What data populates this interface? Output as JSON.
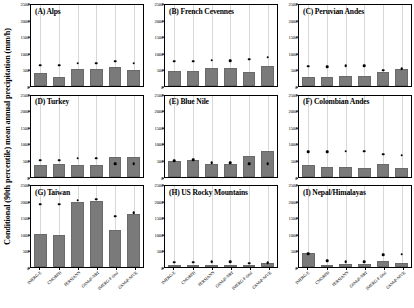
{
  "axis": {
    "ylabel": "Conditional (90th percentile) mean annual precipitation (mm/h)",
    "yticks": [
      0,
      500,
      1000,
      1500,
      2000,
      2500
    ],
    "ymin": 0,
    "ymax": 2500
  },
  "products": [
    "IMERG-E",
    "CMORPH",
    "PERSIANN",
    "GSMaP-NRT",
    "IMERG-F-final",
    "GSMaP-MVK"
  ],
  "colors": {
    "bar": "#7a7a7a",
    "marker": "#000000",
    "grid": "#d8d8d8",
    "axis": "#000000",
    "background": "#ffffff"
  },
  "chart_data": [
    {
      "type": "bar",
      "panel": "A",
      "title": "(A) Alps",
      "categories": [
        "IMERG-E",
        "CMORPH",
        "PERSIANN",
        "GSMaP-NRT",
        "IMERG-F-final",
        "GSMaP-MVK"
      ],
      "values": [
        390,
        290,
        520,
        520,
        600,
        500
      ],
      "markers": [
        640,
        640,
        700,
        700,
        760,
        700
      ],
      "xlabel": "",
      "ylabel": "Conditional (90th percentile) mean annual precipitation (mm/h)",
      "ylim": [
        0,
        2500
      ],
      "grid": true,
      "legend": "none"
    },
    {
      "type": "bar",
      "panel": "B",
      "title": "(B) French Cevennes",
      "categories": [
        "IMERG-E",
        "CMORPH",
        "PERSIANN",
        "GSMaP-NRT",
        "IMERG-F-final",
        "GSMaP-MVK"
      ],
      "values": [
        470,
        470,
        560,
        560,
        430,
        620
      ],
      "markers": [
        760,
        760,
        790,
        780,
        830,
        890
      ],
      "xlabel": "",
      "ylabel": "",
      "ylim": [
        0,
        2500
      ],
      "grid": true,
      "legend": "none"
    },
    {
      "type": "bar",
      "panel": "C",
      "title": "(C) Peruvian Andes",
      "categories": [
        "IMERG-E",
        "CMORPH",
        "PERSIANN",
        "GSMaP-NRT",
        "IMERG-F-final",
        "GSMaP-MVK"
      ],
      "values": [
        290,
        280,
        300,
        300,
        420,
        520
      ],
      "markers": [
        610,
        600,
        620,
        620,
        490,
        540
      ],
      "xlabel": "",
      "ylabel": "",
      "ylim": [
        0,
        2500
      ],
      "grid": true,
      "legend": "none"
    },
    {
      "type": "bar",
      "panel": "D",
      "title": "(D) Turkey",
      "categories": [
        "IMERG-E",
        "CMORPH",
        "PERSIANN",
        "GSMaP-NRT",
        "IMERG-F-final",
        "GSMaP-MVK"
      ],
      "values": [
        370,
        390,
        360,
        360,
        600,
        600
      ],
      "markers": [
        500,
        500,
        560,
        560,
        390,
        390
      ],
      "xlabel": "",
      "ylabel": "",
      "ylim": [
        0,
        2500
      ],
      "grid": true,
      "legend": "none"
    },
    {
      "type": "bar",
      "panel": "E",
      "title": "(E) Blue Nile",
      "categories": [
        "IMERG-E",
        "CMORPH",
        "PERSIANN",
        "GSMaP-NRT",
        "IMERG-F-final",
        "GSMaP-MVK"
      ],
      "values": [
        470,
        520,
        400,
        390,
        630,
        780
      ],
      "markers": [
        480,
        510,
        430,
        420,
        400,
        390
      ],
      "xlabel": "",
      "ylabel": "",
      "ylim": [
        0,
        2500
      ],
      "grid": true,
      "legend": "none"
    },
    {
      "type": "bar",
      "panel": "F",
      "title": "(F) Colombian Andes",
      "categories": [
        "IMERG-E",
        "CMORPH",
        "PERSIANN",
        "GSMaP-NRT",
        "IMERG-F-final",
        "GSMaP-MVK"
      ],
      "values": [
        370,
        280,
        280,
        250,
        390,
        260
      ],
      "markers": [
        760,
        760,
        780,
        780,
        680,
        660
      ],
      "xlabel": "",
      "ylabel": "",
      "ylim": [
        0,
        2500
      ],
      "grid": true,
      "legend": "none"
    },
    {
      "type": "bar",
      "panel": "G",
      "title": "(G) Taiwan",
      "categories": [
        "IMERG-E",
        "CMORPH",
        "PERSIANN",
        "GSMaP-NRT",
        "IMERG-F-final",
        "GSMaP-MVK"
      ],
      "values": [
        1020,
        1000,
        2000,
        2050,
        1150,
        1650
      ],
      "markers": [
        1930,
        1930,
        2060,
        2090,
        1560,
        1680
      ],
      "xlabel": "",
      "ylabel": "",
      "ylim": [
        0,
        2500
      ],
      "grid": true,
      "legend": "none"
    },
    {
      "type": "bar",
      "panel": "H",
      "title": "(H) US Rocky Mountains",
      "categories": [
        "IMERG-E",
        "CMORPH",
        "PERSIANN",
        "GSMaP-NRT",
        "IMERG-F-final",
        "GSMaP-MVK"
      ],
      "values": [
        10,
        10,
        10,
        10,
        60,
        130
      ],
      "markers": [
        150,
        150,
        160,
        160,
        110,
        130
      ],
      "xlabel": "",
      "ylabel": "",
      "ylim": [
        0,
        2500
      ],
      "grid": true,
      "legend": "none"
    },
    {
      "type": "bar",
      "panel": "I",
      "title": "(I) Nepal/Himalayas",
      "categories": [
        "IMERG-E",
        "CMORPH",
        "PERSIANN",
        "GSMaP-NRT",
        "IMERG-F-final",
        "GSMaP-MVK"
      ],
      "values": [
        430,
        60,
        90,
        90,
        190,
        110
      ],
      "markers": [
        400,
        200,
        160,
        160,
        370,
        390
      ],
      "xlabel": "",
      "ylabel": "",
      "ylim": [
        0,
        2500
      ],
      "grid": true,
      "legend": "none"
    }
  ]
}
